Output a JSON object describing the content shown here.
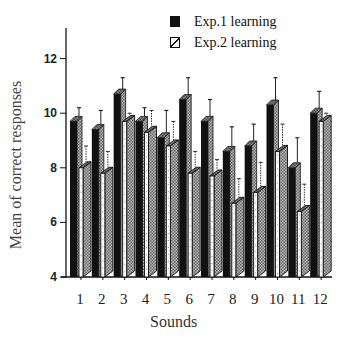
{
  "chart_data": {
    "type": "bar",
    "title": "",
    "xlabel": "Sounds",
    "ylabel": "Mean of correct responses",
    "ylim": [
      4,
      13
    ],
    "yticks": [
      4,
      6,
      8,
      10,
      12
    ],
    "grid": false,
    "legend_position": "top-right",
    "categories": [
      "1",
      "2",
      "3",
      "4",
      "5",
      "6",
      "7",
      "8",
      "9",
      "10",
      "11",
      "12"
    ],
    "series": [
      {
        "name": "Exp.1 learning",
        "values": [
          9.7,
          9.4,
          10.7,
          9.7,
          9.1,
          10.5,
          9.7,
          8.6,
          8.8,
          10.3,
          8.0,
          10.0
        ],
        "error_upper": [
          10.2,
          10.1,
          11.3,
          10.2,
          10.1,
          11.3,
          10.5,
          9.5,
          9.6,
          11.3,
          9.1,
          10.8
        ],
        "style": "solid-black-3d"
      },
      {
        "name": "Exp.2 learning",
        "values": [
          8.0,
          7.8,
          9.7,
          9.3,
          8.8,
          7.8,
          7.7,
          6.7,
          7.1,
          8.6,
          6.4,
          9.7
        ],
        "error_upper": [
          8.8,
          8.6,
          10.0,
          10.1,
          9.7,
          8.6,
          8.3,
          7.6,
          8.2,
          9.6,
          7.4,
          10.0
        ],
        "style": "hatched-gray-3d"
      }
    ]
  },
  "legend": {
    "items": [
      {
        "label": "Exp.1 learning",
        "swatch": "solid-black"
      },
      {
        "label": "Exp.2 learning",
        "swatch": "hatched"
      }
    ]
  },
  "axes": {
    "ylabel": "Mean of correct responses",
    "xlabel": "Sounds"
  },
  "colors": {
    "exp1": "#111111",
    "exp2_face": "#9a9a9a",
    "exp2_side": "#6e6e6e",
    "axis": "#111111"
  }
}
